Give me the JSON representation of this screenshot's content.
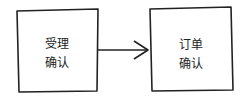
{
  "diagram": {
    "nodes": [
      {
        "id": "accept",
        "line1": "受理",
        "line2": "确认"
      },
      {
        "id": "order",
        "line1": "订单",
        "line2": "确认"
      }
    ],
    "edges": [
      {
        "from": "accept",
        "to": "order"
      }
    ],
    "stroke_color": "#222222"
  }
}
